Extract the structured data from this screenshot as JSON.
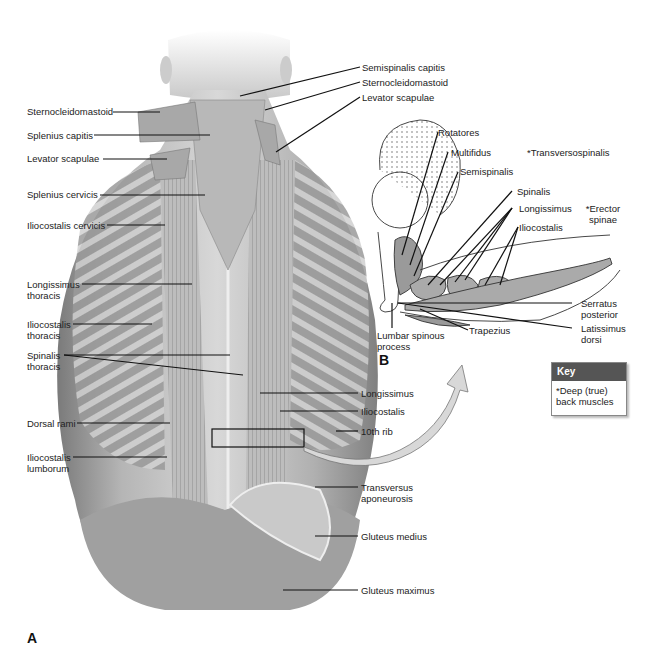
{
  "figure": {
    "panel_a_label": "A",
    "panel_b_label": "B"
  },
  "panel_a": {
    "left_labels": [
      {
        "text": "Sternocleidomastoid"
      },
      {
        "text": "Splenius capitis"
      },
      {
        "text": "Levator scapulae"
      },
      {
        "text": "Splenius cervicis"
      },
      {
        "text": "Iliocostalis cervicis"
      },
      {
        "text": "Longissimus thoracis"
      },
      {
        "text": "Iliocostalis thoracis"
      },
      {
        "text": "Spinalis thoracis"
      },
      {
        "text": "Dorsal rami"
      },
      {
        "text": "Iliocostalis lumborum"
      }
    ],
    "right_labels": [
      {
        "text": "Semispinalis capitis"
      },
      {
        "text": "Sternocleidomastoid"
      },
      {
        "text": "Levator scapulae"
      },
      {
        "text": "Longissimus"
      },
      {
        "text": "Iliocostalis"
      },
      {
        "text": "10th rib"
      },
      {
        "text": "Transversus aponeurosis"
      },
      {
        "text": "Gluteus medius"
      },
      {
        "text": "Gluteus maximus"
      }
    ]
  },
  "panel_b": {
    "labels": [
      {
        "text": "Rotatores"
      },
      {
        "text": "Multifidus"
      },
      {
        "text": "Semispinalis"
      },
      {
        "text": "*Transversospinalis"
      },
      {
        "text": "Spinalis"
      },
      {
        "text": "Longissimus"
      },
      {
        "text": "Iliocostalis"
      },
      {
        "text": "*Erector spinae"
      },
      {
        "text": "Serratus posterior"
      },
      {
        "text": "Latissimus dorsi"
      },
      {
        "text": "Lumbar spinous process"
      },
      {
        "text": "Trapezius"
      }
    ]
  },
  "key": {
    "title": "Key",
    "text": "*Deep (true) back muscles"
  },
  "colors": {
    "key_header": "#555555",
    "arrow_fill": "#d8d8d8"
  }
}
